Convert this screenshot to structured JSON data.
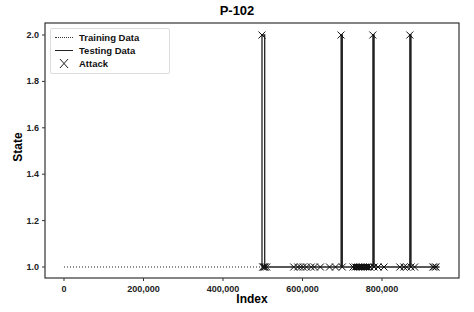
{
  "chart_data": {
    "type": "line",
    "title": "P-102",
    "xlabel": "Index",
    "ylabel": "State",
    "xlim": [
      -30000,
      1010000
    ],
    "ylim": [
      0.95,
      2.05
    ],
    "xticks": [
      0,
      200000,
      400000,
      600000,
      800000
    ],
    "xtick_labels": [
      "0",
      "200,000",
      "400,000",
      "600,000",
      "800,000"
    ],
    "yticks": [
      1.0,
      1.2,
      1.4,
      1.6,
      1.8,
      2.0
    ],
    "ytick_labels": [
      "1.0",
      "1.2",
      "1.4",
      "1.6",
      "1.8",
      "2.0"
    ],
    "grid": false,
    "legend_position": "upper left",
    "series": [
      {
        "name": "Training Data",
        "style": "dotted",
        "x": [
          0,
          496800
        ],
        "y": [
          1.0,
          1.0
        ]
      },
      {
        "name": "Testing Data",
        "style": "solid",
        "x": [
          496800,
          498000,
          498000,
          505000,
          505000,
          697000,
          697000,
          700000,
          700000,
          777000,
          777000,
          780000,
          780000,
          870000,
          870000,
          873000,
          873000,
          945000
        ],
        "y": [
          1.0,
          1.0,
          2.0,
          2.0,
          1.0,
          1.0,
          2.0,
          2.0,
          1.0,
          1.0,
          2.0,
          2.0,
          1.0,
          1.0,
          2.0,
          2.0,
          1.0,
          1.0
        ]
      },
      {
        "name": "Attack",
        "style": "marker-x",
        "x": [
          498000,
          500000,
          502000,
          504000,
          506000,
          510000,
          578000,
          588000,
          595000,
          602000,
          610000,
          622000,
          630000,
          645000,
          668000,
          683000,
          697000,
          700000,
          727000,
          733000,
          740000,
          746000,
          752000,
          758000,
          764000,
          770000,
          777000,
          780000,
          790000,
          805000,
          845000,
          855000,
          862000,
          870000,
          873000,
          882000,
          928000,
          932000,
          936000
        ],
        "y": [
          2.0,
          1.0,
          1.0,
          1.0,
          1.0,
          1.0,
          1.0,
          1.0,
          1.0,
          1.0,
          1.0,
          1.0,
          1.0,
          1.0,
          1.0,
          1.0,
          2.0,
          1.0,
          1.0,
          1.0,
          1.0,
          1.0,
          1.0,
          1.0,
          1.0,
          1.0,
          2.0,
          1.0,
          1.0,
          1.0,
          1.0,
          1.0,
          1.0,
          2.0,
          1.0,
          1.0,
          1.0,
          1.0,
          1.0
        ]
      }
    ]
  },
  "legend": {
    "items": [
      {
        "label": "Training Data",
        "symbol": "dotted-line"
      },
      {
        "label": "Testing Data",
        "symbol": "solid-line"
      },
      {
        "label": "Attack",
        "symbol": "x-marker"
      }
    ]
  }
}
